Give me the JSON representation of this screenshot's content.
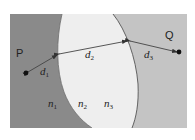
{
  "diagram": {
    "type": "refraction-path-through-three-media",
    "colors": {
      "region_left": "#8a8a8a",
      "region_middle": "#eeeeee",
      "region_right": "#c4c4c4",
      "boundary": "#555555",
      "ray": "#444444",
      "point": "#111111",
      "background": "#ffffff"
    },
    "points": {
      "P": {
        "label": "P"
      },
      "Q": {
        "label": "Q"
      }
    },
    "distances": [
      {
        "id": "d1",
        "base": "d",
        "sub": "1"
      },
      {
        "id": "d2",
        "base": "d",
        "sub": "2"
      },
      {
        "id": "d3",
        "base": "d",
        "sub": "3"
      }
    ],
    "media": [
      {
        "id": "n1",
        "base": "n",
        "sub": "1"
      },
      {
        "id": "n2",
        "base": "n",
        "sub": "2"
      },
      {
        "id": "n3",
        "base": "n",
        "sub": "3"
      }
    ]
  }
}
